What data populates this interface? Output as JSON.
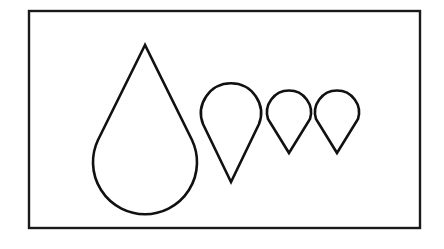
{
  "figure": {
    "background": "#ffffff",
    "stroke_color": "#111111",
    "frame": {
      "x": 29,
      "y": 11,
      "width": 391,
      "height": 217
    },
    "shapes": [
      {
        "name": "large-teardrop",
        "orientation": "point-up",
        "tip": [
          145,
          45
        ],
        "center": [
          145,
          162
        ],
        "radius": 52
      },
      {
        "name": "medium-teardrop",
        "orientation": "point-down",
        "tip": [
          231,
          182
        ],
        "center": [
          231,
          111
        ],
        "radius": 30
      },
      {
        "name": "small-teardrop-1",
        "orientation": "point-down",
        "tip": [
          289,
          153
        ],
        "center": [
          289,
          110
        ],
        "radius": 22
      },
      {
        "name": "small-teardrop-2",
        "orientation": "point-down",
        "tip": [
          337,
          153
        ],
        "center": [
          337,
          110
        ],
        "radius": 22
      }
    ]
  }
}
